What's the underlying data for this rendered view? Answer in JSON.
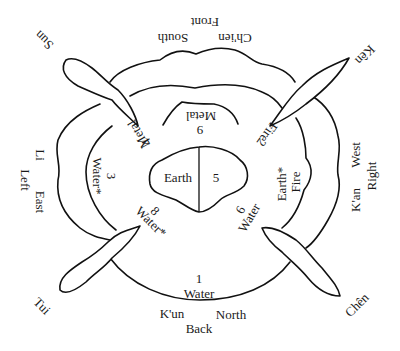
{
  "diagram": {
    "type": "trigram-directions-diagram",
    "trigrams": {
      "top": "Ch'ien",
      "top_left": "Sun",
      "top_right": "Kên",
      "left": "Li",
      "right": "K'an",
      "bottom_left": "Tui",
      "bottom_right": "Chên",
      "bottom": "K'un"
    },
    "directions": {
      "south": "South",
      "north": "North",
      "east": "East",
      "west": "West"
    },
    "positions": {
      "front": "Front",
      "back": "Back",
      "left": "Left",
      "right": "Right"
    },
    "center": {
      "element": "Earth",
      "number": "5"
    },
    "inner_regions": [
      {
        "id": "top",
        "number": "9",
        "element": "Metal"
      },
      {
        "id": "top_left",
        "number": "4",
        "element": "Metal"
      },
      {
        "id": "top_right",
        "number": "2",
        "element": "Fire"
      },
      {
        "id": "left",
        "number": "3",
        "element": "Water*"
      },
      {
        "id": "right",
        "number": "",
        "element_1": "Earth*",
        "element_2": "Fire"
      },
      {
        "id": "bottom_left",
        "number": "8",
        "element": "Water*"
      },
      {
        "id": "bottom_right",
        "number": "6",
        "element": "Water"
      },
      {
        "id": "bottom",
        "number": "1",
        "element": "Water"
      }
    ],
    "colors": {
      "ink": "#111111",
      "paper": "#ffffff"
    }
  }
}
